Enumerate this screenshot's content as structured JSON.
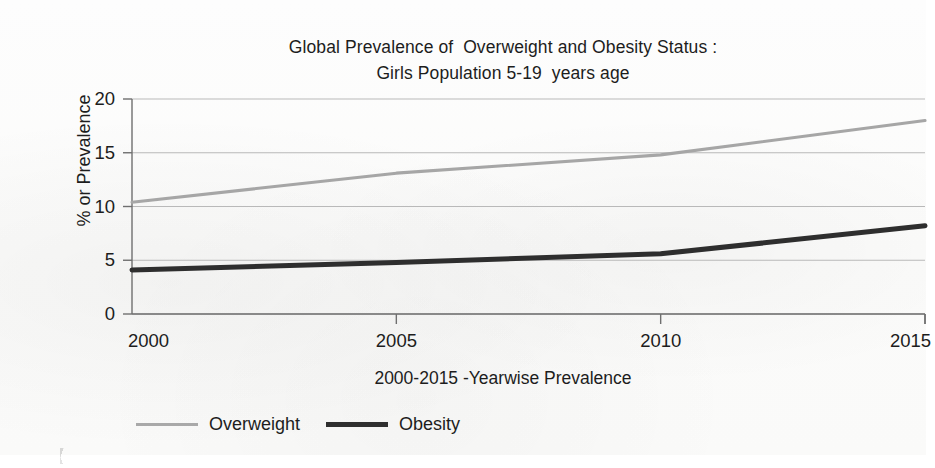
{
  "chart_data": {
    "type": "line",
    "title": "Global Prevalence of  Overweight and Obesity Status :\nGirls Population 5-19  years age",
    "title_line1": "Global Prevalence of  Overweight and Obesity Status :",
    "title_line2": "Girls Population 5-19  years age",
    "xlabel": "2000-2015 -Yearwise Prevalence",
    "ylabel": "% or Prevalence",
    "x": [
      2000,
      2005,
      2010,
      2015
    ],
    "xtick_labels": [
      "2000",
      "2005",
      "2010",
      "2015"
    ],
    "ytick_labels": [
      "0",
      "5",
      "10",
      "15",
      "20"
    ],
    "yticks": [
      0,
      5,
      10,
      15,
      20
    ],
    "ylim": [
      0,
      20
    ],
    "xlim": [
      2000,
      2015
    ],
    "grid": "horizontal",
    "legend_position": "bottom-left",
    "series": [
      {
        "name": "Overweight",
        "color": "#a6a6a6",
        "line_width": "thin",
        "values": [
          10.4,
          13.1,
          14.8,
          18.0
        ]
      },
      {
        "name": "Obesity",
        "color": "#2e2e2e",
        "line_width": "thick",
        "values": [
          4.1,
          4.8,
          5.6,
          8.2
        ]
      }
    ]
  },
  "legend": {
    "items": [
      {
        "label": "Overweight"
      },
      {
        "label": "Obesity"
      }
    ]
  },
  "colors": {
    "overweight": "#a6a6a6",
    "obesity": "#2e2e2e",
    "gridline": "#b9b9b9",
    "axis": "#6f6f6f",
    "text": "#1d1d1d",
    "background": "#fbfbfa"
  }
}
